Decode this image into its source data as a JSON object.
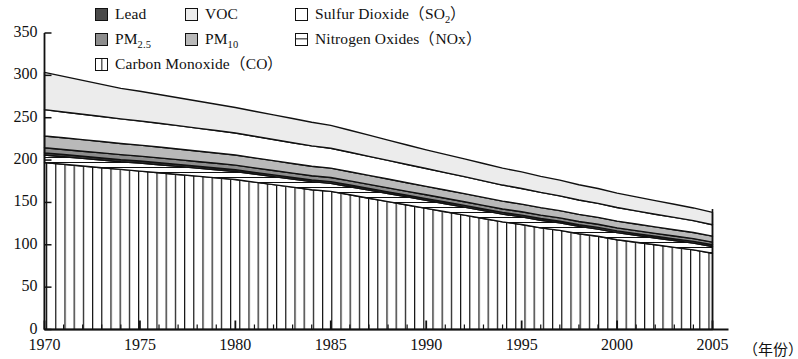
{
  "legend": {
    "rows": [
      [
        {
          "key": "lead",
          "label": "Lead",
          "swatch": "solid-dark-gray",
          "color": "#4a4a4a"
        },
        {
          "key": "voc",
          "label": "VOC",
          "swatch": "solid-very-light-gray",
          "color": "#ececec"
        },
        {
          "key": "so2",
          "label": "Sulfur Dioxide",
          "sub_main": "SO",
          "sub_index": "2",
          "swatch": "empty-white",
          "color": "#ffffff"
        }
      ],
      [
        {
          "key": "pm25",
          "label": "PM",
          "sub_index": "2.5",
          "swatch": "solid-medium-gray",
          "color": "#8d8d8d"
        },
        {
          "key": "pm10",
          "label": "PM",
          "sub_index": "10",
          "swatch": "solid-light-gray",
          "color": "#b9b9b9"
        },
        {
          "key": "nox",
          "label": "Nitrogen Oxides",
          "paren_text": "NOx",
          "swatch": "horizontal-line",
          "color": "#ffffff"
        }
      ],
      [
        {
          "key": "co",
          "label": "Carbon Monoxide",
          "paren_text": "CO",
          "swatch": "vertical-line",
          "color": "#ffffff"
        }
      ]
    ],
    "paren_open": "（",
    "paren_close": "）"
  },
  "axes": {
    "y_ticks": [
      "0",
      "50",
      "100",
      "150",
      "200",
      "250",
      "300",
      "350"
    ],
    "x_ticks": [
      "1970",
      "1975",
      "1980",
      "1985",
      "1990",
      "1995",
      "2000",
      "2005"
    ],
    "x_unit": "（年份）",
    "ylim": [
      0,
      350
    ],
    "xlim": [
      1970,
      2005
    ]
  },
  "chart_data": {
    "type": "area",
    "title": "",
    "xlabel": "（年份）",
    "ylabel": "",
    "xlim": [
      1970,
      2005
    ],
    "ylim": [
      0,
      350
    ],
    "grid": false,
    "legend_position": "top",
    "stacked": true,
    "x": [
      1970,
      1971,
      1972,
      1973,
      1974,
      1975,
      1976,
      1977,
      1978,
      1979,
      1980,
      1981,
      1982,
      1983,
      1984,
      1985,
      1986,
      1987,
      1988,
      1989,
      1990,
      1991,
      1992,
      1993,
      1994,
      1995,
      1996,
      1997,
      1998,
      1999,
      2000,
      2001,
      2002,
      2003,
      2004,
      2005
    ],
    "series": [
      {
        "name": "Carbon Monoxide (CO)",
        "key": "co",
        "pattern": "vertical-line",
        "color": "#ffffff",
        "values": [
          197,
          195,
          193,
          191,
          189,
          187,
          185,
          183,
          181,
          179,
          177,
          174,
          171,
          168,
          165,
          163,
          159,
          155,
          151,
          147,
          143,
          139,
          135,
          131,
          127,
          124,
          120,
          117,
          113,
          110,
          106,
          103,
          100,
          97,
          94,
          90
        ]
      },
      {
        "name": "Nitrogen Oxides (NOx)",
        "key": "nox",
        "pattern": "horizontal-line",
        "color": "#ffffff",
        "values": [
          9,
          9,
          9,
          9,
          9,
          9.5,
          9.5,
          9.5,
          9.5,
          9.5,
          9.5,
          9.5,
          9.5,
          9.5,
          9.5,
          9.5,
          9.5,
          9.5,
          9.5,
          9.5,
          9.5,
          9.5,
          9.5,
          9.3,
          9.2,
          9,
          9,
          8.8,
          8.7,
          8.5,
          8.4,
          8.2,
          8,
          8,
          8,
          8
        ]
      },
      {
        "name": "Lead",
        "key": "lead",
        "pattern": "solid",
        "color": "#4a4a4a",
        "values": [
          2.5,
          2.5,
          2.5,
          2.5,
          2.4,
          2.4,
          2.3,
          2.3,
          2.2,
          2.2,
          2.1,
          2,
          2,
          2,
          2,
          2,
          2,
          2,
          2,
          2,
          2,
          2,
          2,
          2,
          2,
          2,
          2,
          2,
          2,
          2,
          2,
          2,
          2,
          2,
          2,
          2
        ]
      },
      {
        "name": "PM2.5",
        "key": "pm25",
        "pattern": "solid",
        "color": "#8d8d8d",
        "values": [
          6,
          6,
          6,
          6,
          6,
          5.8,
          5.8,
          5.7,
          5.6,
          5.5,
          5.4,
          5.3,
          5.2,
          5.1,
          5,
          5,
          4.9,
          4.8,
          4.7,
          4.6,
          4.5,
          4.4,
          4.3,
          4.2,
          4.1,
          4,
          4,
          3.9,
          3.8,
          3.7,
          3.6,
          3.5,
          3.5,
          3.4,
          3.3,
          3.2
        ]
      },
      {
        "name": "PM10",
        "key": "pm10",
        "pattern": "solid",
        "color": "#b9b9b9",
        "values": [
          14,
          13.8,
          13.6,
          13.4,
          13.2,
          13,
          12.8,
          12.6,
          12.4,
          12.2,
          12,
          11.8,
          11.6,
          11.4,
          11.2,
          11,
          10.8,
          10.6,
          10.4,
          10.2,
          10,
          9.8,
          9.6,
          9.4,
          9.2,
          9,
          8.8,
          8.6,
          8.4,
          8.2,
          8,
          7.8,
          7.6,
          7.4,
          7.2,
          7
        ]
      },
      {
        "name": "Sulfur Dioxide (SO2)",
        "key": "so2",
        "pattern": "solid",
        "color": "#ffffff",
        "values": [
          31,
          30.5,
          30,
          29.5,
          29,
          28.5,
          28,
          27.5,
          27,
          26.5,
          26,
          25.5,
          25,
          24.5,
          24,
          23.5,
          23,
          22.5,
          22,
          21.5,
          21,
          20.5,
          20,
          19.5,
          19,
          18.5,
          18,
          17.5,
          17,
          16.5,
          16,
          15.5,
          15,
          14.5,
          14,
          13.5
        ]
      },
      {
        "name": "VOC",
        "key": "voc",
        "pattern": "solid",
        "color": "#ececec",
        "values": [
          44,
          42,
          40,
          38,
          36,
          35,
          34,
          33,
          32,
          31,
          30,
          29.5,
          29,
          28.5,
          28,
          27,
          26,
          25,
          24,
          23,
          22,
          21.5,
          21,
          20.5,
          20,
          19.5,
          19,
          18.5,
          18,
          17.5,
          17,
          16.5,
          16,
          15.5,
          15,
          14.5
        ]
      }
    ],
    "totals": [
      303.5,
      298.8,
      294.1,
      289.4,
      284.6,
      281.2,
      277.4,
      273.6,
      269.7,
      265.9,
      262,
      257.6,
      253.3,
      248.9,
      244.7,
      241,
      235.2,
      229.4,
      223.6,
      217.8,
      212,
      206.7,
      201.4,
      195.9,
      190.5,
      186,
      180.8,
      176.3,
      171.9,
      167.4,
      163,
      158.5,
      154.1,
      150.3,
      146.5,
      142.2
    ]
  }
}
